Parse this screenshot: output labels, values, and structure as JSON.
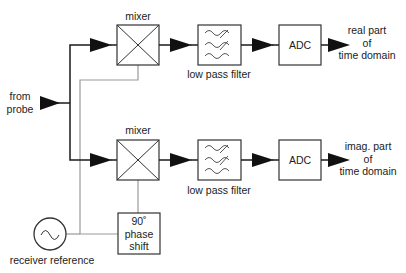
{
  "diagram": {
    "type": "quadrature-detection-block-diagram",
    "input": {
      "line1": "from",
      "line2": "probe"
    },
    "channels": [
      {
        "mixer_label": "mixer",
        "filter_label": "low pass filter",
        "adc_label": "ADC",
        "output": {
          "line1": "real part",
          "line2": "of",
          "line3": "time domain"
        }
      },
      {
        "mixer_label": "mixer",
        "filter_label": "low pass filter",
        "adc_label": "ADC",
        "output": {
          "line1": "imag. part",
          "line2": "of",
          "line3": "time domain"
        }
      }
    ],
    "phase_shift": {
      "line1": "90˚",
      "line2": "phase",
      "line3": "shift"
    },
    "reference": {
      "label": "receiver reference"
    },
    "colors": {
      "signal_line": "#1a1a1a",
      "reference_line": "#9a9a9a",
      "box_border": "#333333"
    }
  }
}
